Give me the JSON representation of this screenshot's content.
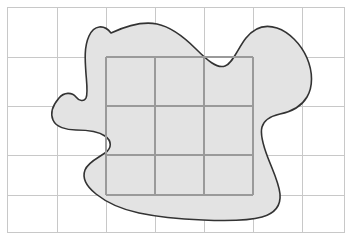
{
  "figure": {
    "width": 352,
    "height": 250
  },
  "colors": {
    "background": "#ffffff",
    "frame_stroke": "#c8c8c8",
    "grid_stroke": "#c8c8c8",
    "inner_grid_stroke": "#9a9a9a",
    "region_fill": "#e3e3e3",
    "region_stroke": "#333333"
  },
  "frame": {
    "x": 7,
    "y": 7,
    "width": 337,
    "height": 225,
    "stroke_width": 1
  },
  "grid": {
    "label": "outer-grid",
    "stroke_width": 1,
    "vertical_lines_x": [
      57,
      106,
      155,
      204,
      253,
      302
    ],
    "horizontal_lines_y": [
      57,
      106,
      155,
      195
    ],
    "columns": 7,
    "rows": 5
  },
  "inner_grid": {
    "label": "inner-counted-cells-grid",
    "stroke_width": 2.4,
    "x_start": 106,
    "x_end": 253,
    "y_start": 57,
    "y_end": 195,
    "vertical_lines_x": [
      106,
      155,
      204,
      253
    ],
    "horizontal_lines_y": [
      57,
      106,
      155,
      195
    ],
    "columns": 3,
    "rows": 3,
    "cell_count": 9
  },
  "region": {
    "label": "irregular-region",
    "fill": "#e3e3e3",
    "stroke": "#333333",
    "stroke_width": 1.6,
    "path": "M 111 33 C 104 24 94 25 89 36 C 84 47 85 60 86 74 C 87 86 88 94 86 98 C 84 102 79 101 76 97 C 72 92 64 92 59 98 C 53 105 50 113 53 120 C 56 127 66 130 76 130 C 86 130 98 131 105 136 C 112 141 112 148 105 153 C 98 158 88 162 85 170 C 82 178 86 186 96 194 C 106 202 120 209 139 213 C 158 217 180 219 203 220 C 226 221 248 221 262 217 C 276 213 281 205 280 194 C 279 183 273 171 268 158 C 263 145 260 134 262 127 C 264 120 271 116 280 114 C 290 112 301 107 307 97 C 313 87 313 72 307 58 C 301 44 289 32 277 28 C 265 24 254 28 246 38 C 238 48 233 63 225 66 C 217 69 207 60 196 49 C 185 38 172 27 157 24 C 142 21 126 26 111 33 Z"
  }
}
